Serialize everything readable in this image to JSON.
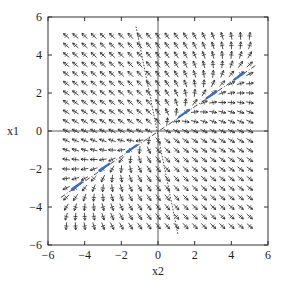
{
  "chart_data": {
    "type": "quiver",
    "title": "",
    "xlabel": "x2",
    "ylabel": "x1",
    "xlim": [
      -6,
      6
    ],
    "ylim": [
      -6,
      6
    ],
    "xticks": [
      -6,
      -4,
      -2,
      0,
      2,
      4,
      6
    ],
    "yticks": [
      -6,
      -4,
      -2,
      0,
      2,
      4,
      6
    ],
    "xtick_labels": [
      "−6",
      "−4",
      "−2",
      "0",
      "2",
      "4",
      "6"
    ],
    "ytick_labels": [
      "−6",
      "−4",
      "−2",
      "0",
      "2",
      "4",
      "6"
    ],
    "grid": false,
    "zero_lines": true,
    "vector_field": {
      "x2_range": [
        -5,
        5
      ],
      "x1_range": [
        -5,
        5
      ],
      "step": 0.5,
      "matrix_A": [
        [
          0.2,
          0.0
        ],
        [
          1.0,
          -1.0
        ]
      ],
      "description": "Phase portrait dx/dt = A x; arrows show normalized direction field sampled on a 21x21 grid"
    },
    "eigenlines": [
      {
        "name": "unstable eigenvector line",
        "style": "dash-dot",
        "points": [
          [
            -5.3,
            -3.5
          ],
          [
            5.4,
            3.5
          ]
        ]
      },
      {
        "name": "stable eigenvector line",
        "style": "dotted",
        "points": [
          [
            -1.2,
            5.5
          ],
          [
            1.1,
            -5.5
          ]
        ]
      }
    ],
    "trajectory_markers": {
      "color": "#3a6fc4",
      "points_x2": [
        -4.5,
        -3.0,
        -1.5,
        1.5,
        3.0,
        4.5
      ],
      "slope": 0.65
    }
  },
  "colors": {
    "axis": "#333333",
    "arrows": "#222222",
    "markers": "#3a6fc4"
  }
}
